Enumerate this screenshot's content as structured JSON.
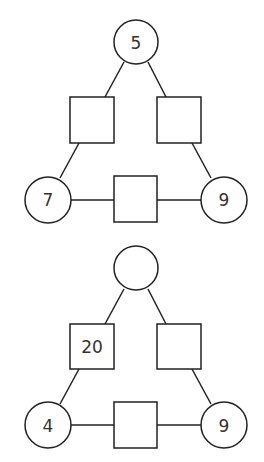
{
  "puzzles": [
    {
      "top_circle": "5",
      "left_circle": "7",
      "right_circle": "9",
      "left_square": "",
      "right_square": "",
      "bottom_square": ""
    },
    {
      "top_circle": "",
      "left_circle": "4",
      "right_circle": "9",
      "left_square": "20",
      "right_square": "",
      "bottom_square": ""
    }
  ]
}
